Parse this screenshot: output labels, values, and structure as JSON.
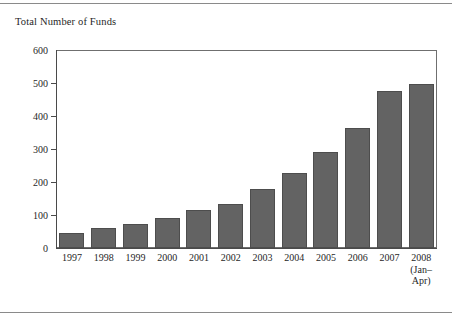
{
  "figure": {
    "y_axis_caption": "Total Number of Funds",
    "bar_color": "#636363",
    "axis_color": "#4a4a4a",
    "frame_color": "#6f6f6f",
    "rule_color": "#8a8a8a"
  },
  "chart_data": {
    "type": "bar",
    "title": "Total Number of Funds",
    "xlabel": "",
    "ylabel": "Total Number of Funds",
    "ylim": [
      0,
      600
    ],
    "yticks": [
      0,
      100,
      200,
      300,
      400,
      500,
      600
    ],
    "ytick_labels": [
      "0",
      "100",
      "200",
      "300",
      "400",
      "500",
      "600"
    ],
    "grid": false,
    "legend": null,
    "categories": [
      "1997",
      "1998",
      "1999",
      "2000",
      "2001",
      "2002",
      "2003",
      "2004",
      "2005",
      "2006",
      "2007",
      "2008"
    ],
    "category_sublabels": [
      "",
      "",
      "",
      "",
      "",
      "",
      "",
      "",
      "",
      "",
      "",
      "(Jan–\nApr)"
    ],
    "values": [
      47,
      62,
      73,
      90,
      115,
      133,
      180,
      228,
      290,
      363,
      475,
      498
    ]
  }
}
